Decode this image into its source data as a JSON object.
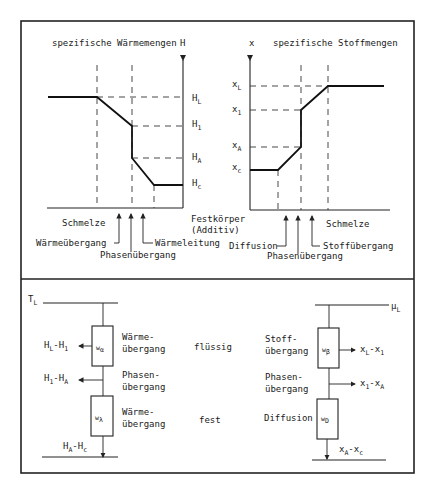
{
  "top": {
    "heat_chart": {
      "title": "spezifische Wärmemengen",
      "axis_label": "H",
      "levels": [
        {
          "name": "H",
          "sub": "L"
        },
        {
          "name": "H",
          "sub": "1"
        },
        {
          "name": "H",
          "sub": "A"
        },
        {
          "name": "H",
          "sub": "c"
        }
      ],
      "zone_labels": {
        "melt": "Schmelze",
        "solid_line1": "Festkörper",
        "solid_line2": "(Additiv)"
      },
      "arrow_labels": {
        "transfer": "Wärmeübergang",
        "phase": "Phasenübergang",
        "conduction": "Wärmeleitung"
      }
    },
    "mass_chart": {
      "title": "spezifische Stoffmengen",
      "axis_label": "x",
      "levels": [
        {
          "name": "x",
          "sub": "L"
        },
        {
          "name": "x",
          "sub": "1"
        },
        {
          "name": "x",
          "sub": "A"
        },
        {
          "name": "x",
          "sub": "c"
        }
      ],
      "zone_labels": {
        "melt": "Schmelze"
      },
      "arrow_labels": {
        "diffusion": "Diffusion",
        "phase": "Phasenübergang",
        "transfer": "Stoffübergang"
      }
    }
  },
  "bottom": {
    "heat_circuit": {
      "top_label": {
        "name": "T",
        "sub": "L"
      },
      "box1": {
        "name": "w",
        "sub": "α"
      },
      "box2": {
        "name": "w",
        "sub": "λ"
      },
      "out1": {
        "a": "H",
        "a_sub": "L",
        "b": "H",
        "b_sub": "1"
      },
      "out2": {
        "a": "H",
        "a_sub": "1",
        "b": "H",
        "b_sub": "A"
      },
      "out3": {
        "a": "H",
        "a_sub": "A",
        "b": "H",
        "b_sub": "c"
      },
      "desc1_line1": "Wärme-",
      "desc1_line2": "übergang",
      "desc2_line1": "Phasen-",
      "desc2_line2": "übergang",
      "desc3_line1": "Wärme-",
      "desc3_line2": "übergang"
    },
    "phase_labels": {
      "liquid": "flüssig",
      "solid": "fest"
    },
    "mass_circuit": {
      "top_label": {
        "name": "μ",
        "sub": "L"
      },
      "box1": {
        "name": "w",
        "sub": "β"
      },
      "box2": {
        "name": "w",
        "sub": "D"
      },
      "out1": {
        "a": "x",
        "a_sub": "L",
        "b": "x",
        "b_sub": "1"
      },
      "out2": {
        "a": "x",
        "a_sub": "1",
        "b": "x",
        "b_sub": "A"
      },
      "out3": {
        "a": "x",
        "a_sub": "A",
        "b": "x",
        "b_sub": "c"
      },
      "desc1_line1": "Stoff-",
      "desc1_line2": "übergang",
      "desc2_line1": "Phasen-",
      "desc2_line2": "übergang",
      "desc3_line1": "Diffusion"
    }
  }
}
